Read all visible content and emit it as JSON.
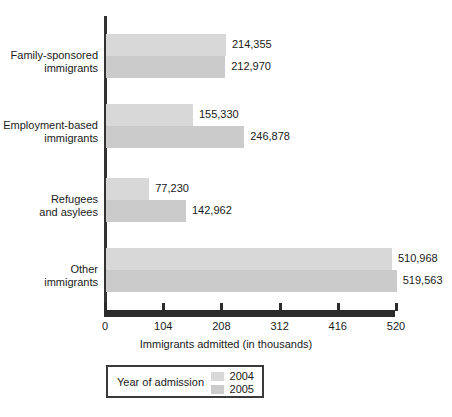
{
  "chart_data": {
    "type": "bar",
    "orientation": "horizontal",
    "title": "",
    "xlabel": "Immigrants admitted (in thousands)",
    "ylabel": "",
    "xlim": [
      0,
      520
    ],
    "xticks": [
      0,
      104,
      208,
      312,
      416,
      520
    ],
    "xtick_labels": [
      "0",
      "104",
      "208",
      "312",
      "416",
      "520"
    ],
    "grid": false,
    "legend_position": "bottom-left",
    "categories": [
      "Family-sponsored immigrants",
      "Employment-based immigrants",
      "Refugees and asylees",
      "Other immigrants"
    ],
    "category_lines": [
      [
        "Family-sponsored",
        "immigrants"
      ],
      [
        "Employment-based",
        "immigrants"
      ],
      [
        "Refugees",
        "and asylees"
      ],
      [
        "Other",
        "immigrants"
      ]
    ],
    "series": [
      {
        "name": "2004",
        "color": "#d8d8d8",
        "values": [
          214.355,
          155.33,
          77.23,
          510.968
        ],
        "labels": [
          "214,355",
          "155,330",
          "77,230",
          "510,968"
        ]
      },
      {
        "name": "2005",
        "color": "#cbcbcb",
        "values": [
          212.97,
          246.878,
          142.962,
          519.563
        ],
        "labels": [
          "212,970",
          "246,878",
          "142,962",
          "519,563"
        ]
      }
    ]
  },
  "legend": {
    "title": "Year of admission",
    "entries": [
      {
        "label": "2004",
        "color": "#d8d8d8"
      },
      {
        "label": "2005",
        "color": "#cbcbcb"
      }
    ]
  }
}
